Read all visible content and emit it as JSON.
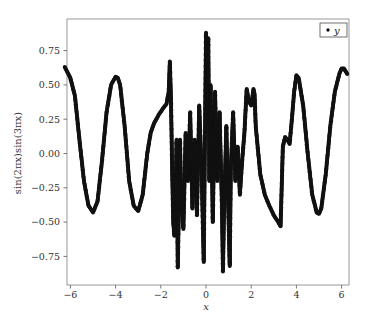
{
  "chart_data": {
    "type": "scatter",
    "title": "",
    "xlabel": "x",
    "ylabel": "sin(2πx)sin(3πx)",
    "xlim": [
      -6.25,
      6.35
    ],
    "ylim": [
      -0.96,
      0.98
    ],
    "xticks": [
      -6,
      -4,
      -2,
      0,
      2,
      4,
      6
    ],
    "xtick_labels": [
      "−6",
      "−4",
      "−2",
      "0",
      "2",
      "4",
      "6"
    ],
    "yticks": [
      0.75,
      0.5,
      0.25,
      0.0,
      -0.25,
      -0.5,
      -0.75
    ],
    "ytick_labels": [
      "0.75",
      "0.50",
      "0.25",
      "0.00",
      "−0.25",
      "−0.50",
      "−0.75"
    ],
    "grid": false,
    "legend": {
      "position": "upper right",
      "entries": [
        "y"
      ]
    },
    "marker_color": "#111111",
    "series": [
      {
        "name": "y",
        "x": [
          -6.25,
          -6.0,
          -5.8,
          -5.6,
          -5.4,
          -5.2,
          -5.0,
          -4.8,
          -4.6,
          -4.4,
          -4.2,
          -4.0,
          -3.9,
          -3.8,
          -3.6,
          -3.4,
          -3.2,
          -3.0,
          -2.8,
          -2.6,
          -2.45,
          -2.3,
          -2.1,
          -1.9,
          -1.75,
          -1.65,
          -1.6,
          -1.55,
          -1.5,
          -1.45,
          -1.4,
          -1.35,
          -1.3,
          -1.25,
          -1.2,
          -1.15,
          -1.1,
          -1.0,
          -0.9,
          -0.8,
          -0.7,
          -0.6,
          -0.5,
          -0.4,
          -0.3,
          -0.2,
          -0.1,
          0.0,
          0.05,
          0.1,
          0.15,
          0.2,
          0.3,
          0.4,
          0.5,
          0.6,
          0.7,
          0.75,
          0.8,
          0.9,
          1.0,
          1.05,
          1.1,
          1.2,
          1.3,
          1.4,
          1.5,
          1.6,
          1.7,
          1.8,
          1.9,
          2.0,
          2.1,
          2.15,
          2.2,
          2.4,
          2.6,
          2.8,
          3.0,
          3.2,
          3.3,
          3.4,
          3.5,
          3.6,
          3.7,
          3.8,
          3.9,
          4.0,
          4.1,
          4.3,
          4.5,
          4.7,
          4.9,
          5.0,
          5.1,
          5.3,
          5.5,
          5.7,
          5.9,
          6.0,
          6.1,
          6.25
        ],
        "y": [
          0.63,
          0.55,
          0.42,
          0.1,
          -0.2,
          -0.38,
          -0.43,
          -0.35,
          -0.05,
          0.3,
          0.5,
          0.56,
          0.55,
          0.5,
          0.2,
          -0.2,
          -0.38,
          -0.42,
          -0.3,
          0.0,
          0.15,
          0.22,
          0.28,
          0.33,
          0.36,
          0.45,
          0.67,
          0.4,
          -0.1,
          -0.5,
          -0.6,
          -0.35,
          0.1,
          -0.83,
          -0.4,
          0.1,
          -0.3,
          -0.55,
          0.15,
          -0.2,
          0.3,
          -0.4,
          0.1,
          -0.45,
          0.35,
          -0.1,
          -0.79,
          0.88,
          0.3,
          0.84,
          -0.2,
          0.5,
          -0.5,
          0.45,
          -0.2,
          0.3,
          -0.35,
          -0.86,
          -0.4,
          0.2,
          -0.5,
          -0.82,
          -0.1,
          0.3,
          -0.2,
          0.05,
          -0.3,
          -0.05,
          0.15,
          0.47,
          0.38,
          0.35,
          0.47,
          0.43,
          0.2,
          -0.15,
          -0.3,
          -0.38,
          -0.45,
          -0.5,
          -0.53,
          0.05,
          0.12,
          0.1,
          0.07,
          0.25,
          0.45,
          0.57,
          0.55,
          0.35,
          0.0,
          -0.3,
          -0.43,
          -0.44,
          -0.4,
          -0.15,
          0.2,
          0.45,
          0.58,
          0.62,
          0.62,
          0.58
        ]
      }
    ]
  }
}
